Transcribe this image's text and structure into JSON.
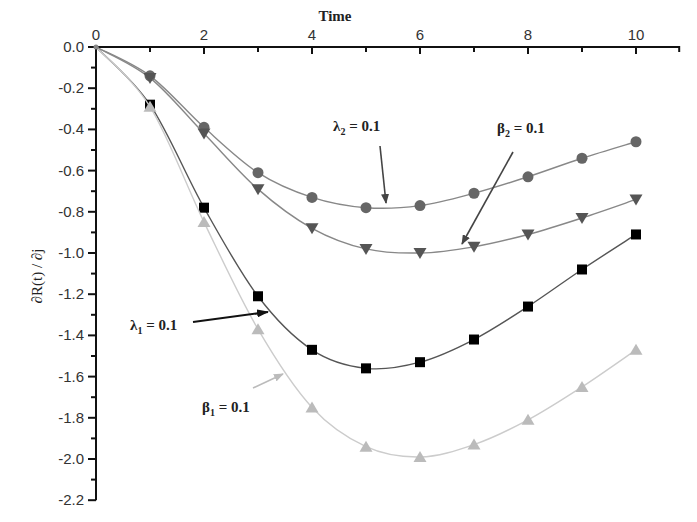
{
  "chart_data": {
    "type": "line",
    "title": "",
    "xlabel": "Time",
    "ylabel": "∂R(t) / ∂j",
    "xlim": [
      0,
      10.8
    ],
    "ylim": [
      -2.2,
      0.0
    ],
    "x_ticks": [
      0,
      2,
      4,
      6,
      8,
      10
    ],
    "y_ticks": [
      0.0,
      -0.2,
      -0.4,
      -0.6,
      -0.8,
      -1.0,
      -1.2,
      -1.4,
      -1.6,
      -1.8,
      -2.0,
      -2.2
    ],
    "y_tick_labels": [
      "0.0",
      "-0.2",
      "-0.4",
      "-0.6",
      "-0.8",
      "-1.0",
      "-1.2",
      "-1.4",
      "-1.6",
      "-1.8",
      "-2.0",
      "-2.2"
    ],
    "x_axis_position": "top",
    "grid": false,
    "legend": null,
    "x": [
      0,
      1,
      2,
      3,
      4,
      5,
      6,
      7,
      8,
      9,
      10
    ],
    "series": [
      {
        "name": "λ2 = 0.1",
        "marker": "circle",
        "color": "#666666",
        "line_color": "#888888",
        "values": [
          0.0,
          -0.14,
          -0.39,
          -0.61,
          -0.73,
          -0.78,
          -0.77,
          -0.71,
          -0.63,
          -0.54,
          -0.46
        ]
      },
      {
        "name": "β2 = 0.1",
        "marker": "triangle-down",
        "color": "#555555",
        "line_color": "#888888",
        "values": [
          0.0,
          -0.15,
          -0.42,
          -0.69,
          -0.88,
          -0.98,
          -1.0,
          -0.97,
          -0.91,
          -0.83,
          -0.74
        ]
      },
      {
        "name": "λ1 = 0.1",
        "marker": "square",
        "color": "#000000",
        "line_color": "#555555",
        "values": [
          0.0,
          -0.28,
          -0.78,
          -1.21,
          -1.47,
          -1.56,
          -1.53,
          -1.42,
          -1.26,
          -1.08,
          -0.91
        ]
      },
      {
        "name": "β1 = 0.1",
        "marker": "triangle-up",
        "color": "#bbbbbb",
        "line_color": "#cccccc",
        "values": [
          0.0,
          -0.29,
          -0.85,
          -1.37,
          -1.75,
          -1.94,
          -1.99,
          -1.93,
          -1.81,
          -1.65,
          -1.47
        ]
      }
    ],
    "annotations": [
      {
        "text": "λ",
        "sub": "2",
        "suffix": " = 0.1",
        "text_x": 333,
        "text_y": 131,
        "arrow_from": [
          380,
          146
        ],
        "arrow_to": [
          386,
          203
        ],
        "arrow_color": "#444444"
      },
      {
        "text": "β",
        "sub": "2",
        "suffix": " = 0.1",
        "text_x": 497,
        "text_y": 133,
        "arrow_from": [
          513,
          152
        ],
        "arrow_to": [
          462,
          244
        ],
        "arrow_color": "#444444"
      },
      {
        "text": "λ",
        "sub": "1",
        "suffix": " = 0.1",
        "text_x": 130,
        "text_y": 330,
        "arrow_from": [
          193,
          322
        ],
        "arrow_to": [
          268,
          312
        ],
        "arrow_color": "#111111"
      },
      {
        "text": "β",
        "sub": "1",
        "suffix": " = 0.1",
        "text_x": 202,
        "text_y": 412,
        "arrow_from": [
          253,
          388
        ],
        "arrow_to": [
          283,
          374
        ],
        "arrow_color": "#bbbbbb"
      }
    ]
  },
  "labels": {
    "xlabel": "Time",
    "ylabel": "∂R(t) / ∂j"
  }
}
